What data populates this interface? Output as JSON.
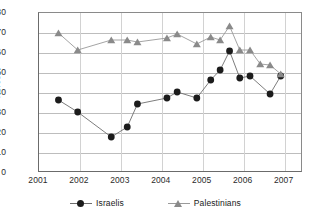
{
  "chart_data": {
    "type": "line",
    "title": "",
    "subtitle": "",
    "xlabel": "",
    "ylabel": "Percent",
    "ylim": [
      0,
      80
    ],
    "ytick_step": 10,
    "yticks": [
      "80",
      "70",
      "60",
      "50",
      "40",
      "30",
      "20",
      "10",
      "0"
    ],
    "xlim": [
      2001,
      2007.45
    ],
    "xticks": [
      "2001",
      "2002",
      "2003",
      "2004",
      "2005",
      "2006",
      "2007"
    ],
    "grid": "horizontal-and-vertical",
    "legend_position": "bottom-center",
    "series": [
      {
        "name": "Israelis",
        "color": "#1c1c1c",
        "line_color": "#6e6e6e",
        "marker": "circle",
        "points": [
          {
            "x": 2001.5,
            "y": 36
          },
          {
            "x": 2001.97,
            "y": 30
          },
          {
            "x": 2002.79,
            "y": 17.5
          },
          {
            "x": 2003.18,
            "y": 22.5
          },
          {
            "x": 2003.43,
            "y": 34
          },
          {
            "x": 2004.15,
            "y": 37
          },
          {
            "x": 2004.4,
            "y": 40
          },
          {
            "x": 2004.88,
            "y": 37
          },
          {
            "x": 2005.22,
            "y": 46
          },
          {
            "x": 2005.45,
            "y": 51
          },
          {
            "x": 2005.68,
            "y": 60.5
          },
          {
            "x": 2005.93,
            "y": 47
          },
          {
            "x": 2006.18,
            "y": 48
          },
          {
            "x": 2006.67,
            "y": 39
          },
          {
            "x": 2006.93,
            "y": 48
          }
        ]
      },
      {
        "name": "Palestinians",
        "color": "#8a8a8a",
        "line_color": "#9a9a9a",
        "marker": "triangle",
        "points": [
          {
            "x": 2001.5,
            "y": 69.5
          },
          {
            "x": 2001.97,
            "y": 61
          },
          {
            "x": 2002.79,
            "y": 66
          },
          {
            "x": 2003.18,
            "y": 66
          },
          {
            "x": 2003.43,
            "y": 65
          },
          {
            "x": 2004.15,
            "y": 67
          },
          {
            "x": 2004.4,
            "y": 69
          },
          {
            "x": 2004.88,
            "y": 64
          },
          {
            "x": 2005.22,
            "y": 67.5
          },
          {
            "x": 2005.45,
            "y": 66
          },
          {
            "x": 2005.68,
            "y": 73
          },
          {
            "x": 2005.93,
            "y": 61
          },
          {
            "x": 2006.18,
            "y": 61
          },
          {
            "x": 2006.43,
            "y": 54
          },
          {
            "x": 2006.67,
            "y": 53.5
          },
          {
            "x": 2006.93,
            "y": 49
          }
        ]
      }
    ]
  },
  "legend": {
    "items": [
      {
        "label": "Israelis",
        "marker": "circle-marker",
        "color": "#1c1c1c"
      },
      {
        "label": "Palestinians",
        "marker": "triangle-marker",
        "color": "#8a8a8a"
      }
    ]
  },
  "axes": {
    "y_axis_title": "Percent"
  }
}
